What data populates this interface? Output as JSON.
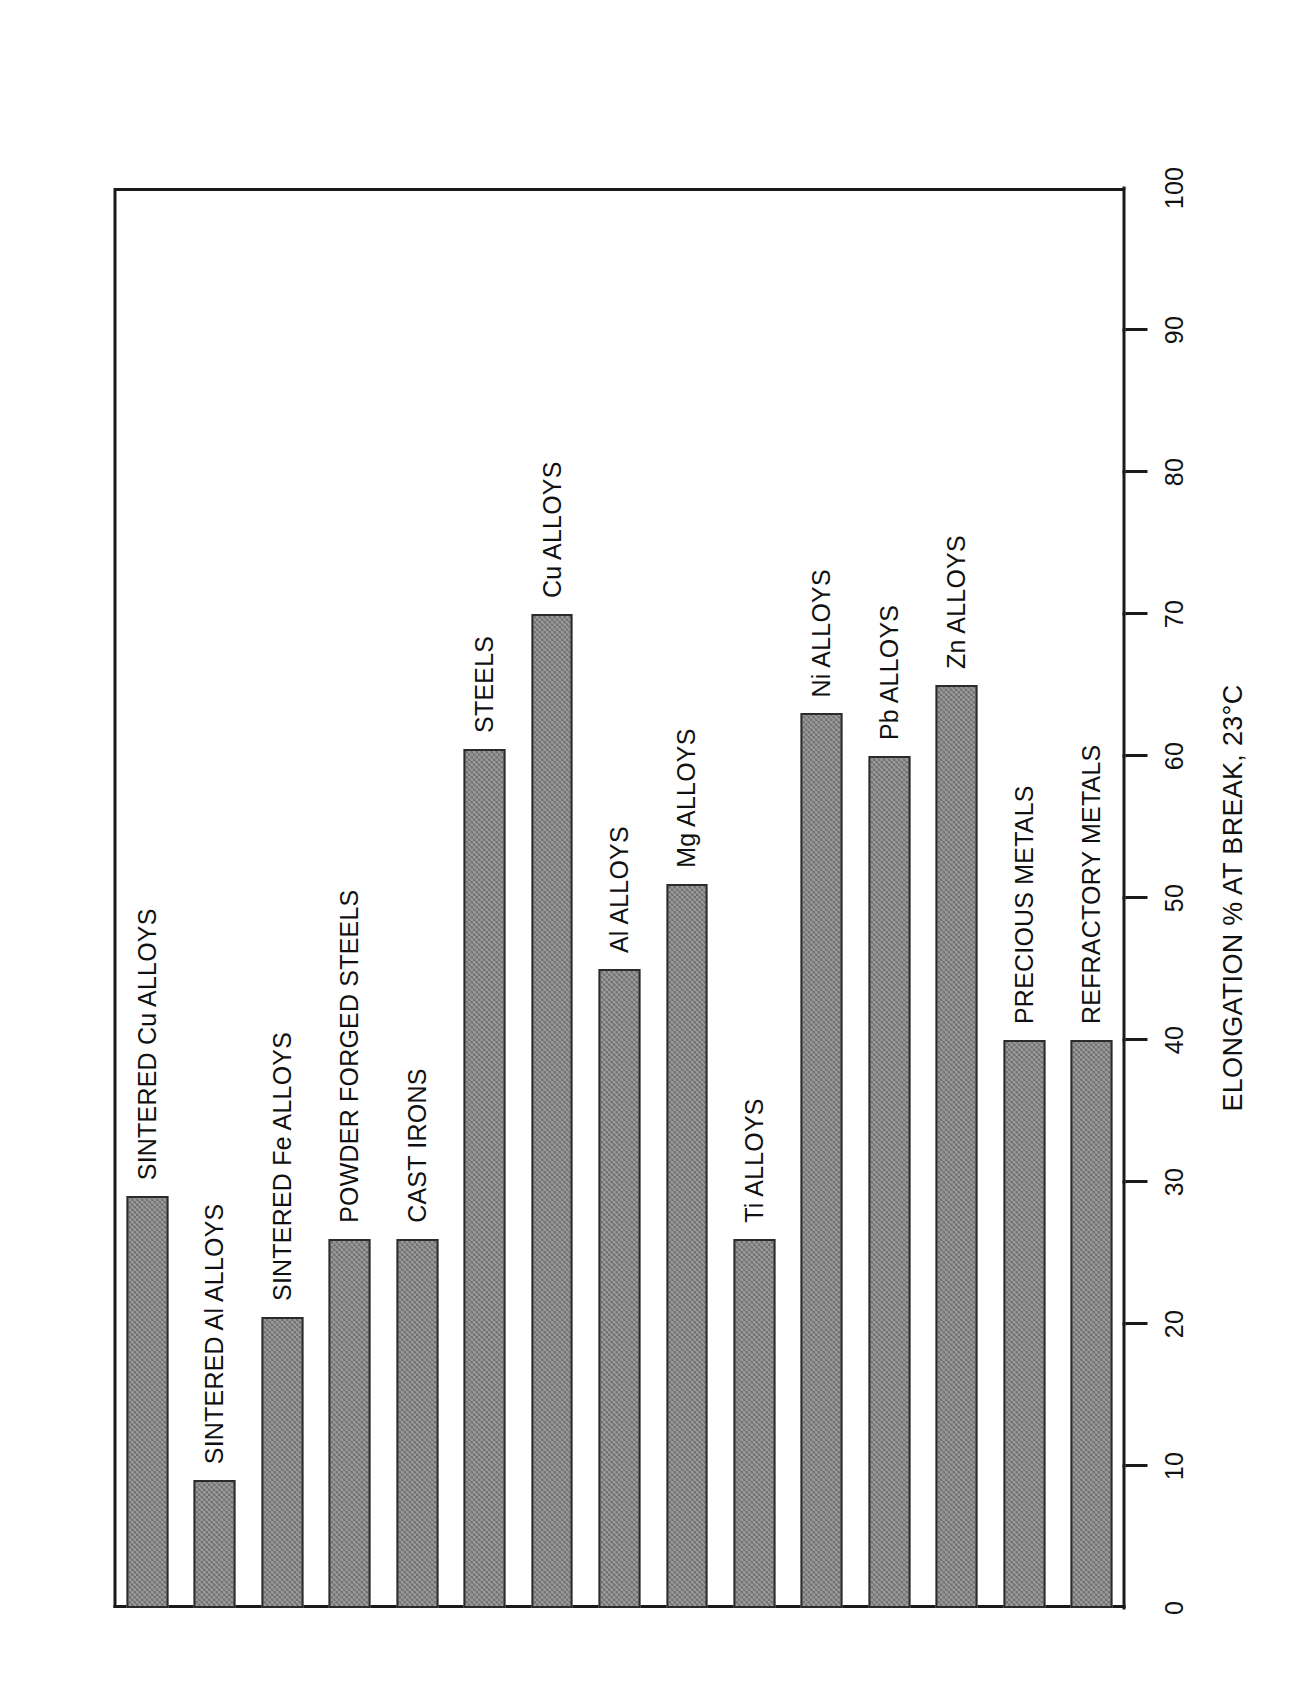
{
  "figure": {
    "caption": "FIG 1.2.6 Elongation values of materials (a) metals",
    "axis_title": "ELONGATION % AT BREAK, 23°C"
  },
  "chart_data": {
    "type": "bar",
    "title": "",
    "orientation": "horizontal-rotated",
    "xlabel": "",
    "ylabel": "ELONGATION % AT BREAK, 23°C",
    "ylim": [
      0,
      100
    ],
    "grid": false,
    "legend": "none",
    "tick_labels": [
      "0",
      "10",
      "20",
      "30",
      "40",
      "50",
      "60",
      "70",
      "80",
      "90",
      "100"
    ],
    "tick_values": [
      0,
      10,
      20,
      30,
      40,
      50,
      60,
      70,
      80,
      90,
      100
    ],
    "categories": [
      "SINTERED Cu ALLOYS",
      "SINTERED Al ALLOYS",
      "SINTERED Fe ALLOYS",
      "POWDER FORGED STEELS",
      "CAST IRONS",
      "STEELS",
      "Cu ALLOYS",
      "Al ALLOYS",
      "Mg ALLOYS",
      "Ti ALLOYS",
      "Ni ALLOYS",
      "Pb ALLOYS",
      "Zn ALLOYS",
      "PRECIOUS METALS",
      "REFRACTORY METALS"
    ],
    "values": [
      29,
      9,
      20.5,
      26,
      26,
      60.5,
      70,
      45,
      51,
      26,
      63,
      60,
      65,
      40,
      40
    ],
    "bar_count": 15,
    "fill": "#9b9b9b",
    "edge": "#2b2b2b"
  }
}
